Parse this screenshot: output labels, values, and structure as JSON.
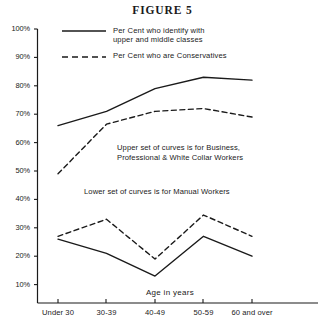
{
  "figure": {
    "title": "FIGURE 5"
  },
  "legend": {
    "solid": "Per Cent who identify with\nupper and middle classes",
    "dashed": "Per Cent who are Conservatives"
  },
  "annotations": {
    "upper": "Upper set of curves is for Business,\nProfessional & White Collar Workers",
    "lower": "Lower set of curves is for Manual Workers"
  },
  "colors": {
    "ink": "#1a1a1a",
    "axis": "#1a1a1a",
    "background": "#ffffff"
  },
  "chart_data": {
    "type": "line",
    "title": "FIGURE 5",
    "xlabel": "Age in years",
    "ylabel": "",
    "categories": [
      "Under 30",
      "30-39",
      "40-49",
      "50-59",
      "60 and over"
    ],
    "x": [
      0,
      1,
      2,
      3,
      4
    ],
    "ylim": [
      0,
      100
    ],
    "ytick_labels": [
      "10%",
      "20%",
      "30%",
      "40%",
      "50%",
      "60%",
      "70%",
      "80%",
      "90%",
      "100%"
    ],
    "ytick_values": [
      10,
      20,
      30,
      40,
      50,
      60,
      70,
      80,
      90,
      100
    ],
    "grid": false,
    "legend_position": "top-left",
    "series": [
      {
        "name": "Per Cent who identify with upper and middle classes",
        "group": "Business, Professional & White Collar Workers",
        "style": "solid",
        "values": [
          66,
          71,
          79,
          83,
          82
        ]
      },
      {
        "name": "Per Cent who are Conservatives",
        "group": "Business, Professional & White Collar Workers",
        "style": "dashed",
        "values": [
          49,
          66.5,
          71,
          72,
          69
        ]
      },
      {
        "name": "Per Cent who identify with upper and middle classes",
        "group": "Manual Workers",
        "style": "solid",
        "values": [
          26,
          21,
          13,
          27,
          20
        ]
      },
      {
        "name": "Per Cent who are Conservatives",
        "group": "Manual Workers",
        "style": "dashed",
        "values": [
          27,
          33,
          19,
          34.5,
          27
        ]
      }
    ]
  }
}
